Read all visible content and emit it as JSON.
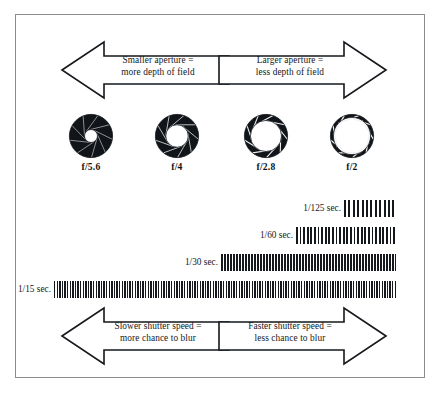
{
  "diagram": {
    "frame_color": "#8c8c8c",
    "ink_color": "#15181c"
  },
  "top_arrows": {
    "left": {
      "direction": "left",
      "icon": "arrow-left-icon",
      "line1": "Smaller aperture  =",
      "line2": "more depth of field"
    },
    "right": {
      "direction": "right",
      "icon": "arrow-right-icon",
      "line1": "Larger aperture  =",
      "line2": "less depth of field"
    }
  },
  "apertures": [
    {
      "label": "f/5.6",
      "icon": "aperture-iris-icon",
      "opening_ratio": 0.3,
      "blades": 9
    },
    {
      "label": "f/4",
      "icon": "aperture-iris-icon",
      "opening_ratio": 0.52,
      "blades": 9
    },
    {
      "label": "f/2.8",
      "icon": "aperture-iris-icon",
      "opening_ratio": 0.72,
      "blades": 9
    },
    {
      "label": "f/2",
      "icon": "aperture-iris-icon",
      "opening_ratio": 0.86,
      "blades": 9
    }
  ],
  "shutter_speeds": [
    {
      "label": "1/125 sec.",
      "bar_width": 52,
      "stripe_period": 4.4,
      "stripe_width": 2.0
    },
    {
      "label": "1/60 sec.",
      "bar_width": 100,
      "stripe_period": 3.6,
      "stripe_width": 1.8
    },
    {
      "label": "1/30 sec.",
      "bar_width": 175,
      "stripe_period": 3.0,
      "stripe_width": 1.6
    },
    {
      "label": "1/15 sec.",
      "bar_width": 342,
      "stripe_period": 2.6,
      "stripe_width": 1.4
    }
  ],
  "bottom_arrows": {
    "left": {
      "direction": "left",
      "icon": "arrow-left-icon",
      "line1": "Slower shutter speed  =",
      "line2": "more chance to blur"
    },
    "right": {
      "direction": "right",
      "icon": "arrow-right-icon",
      "line1": "Faster shutter speed  =",
      "line2": "less chance to blur"
    }
  }
}
